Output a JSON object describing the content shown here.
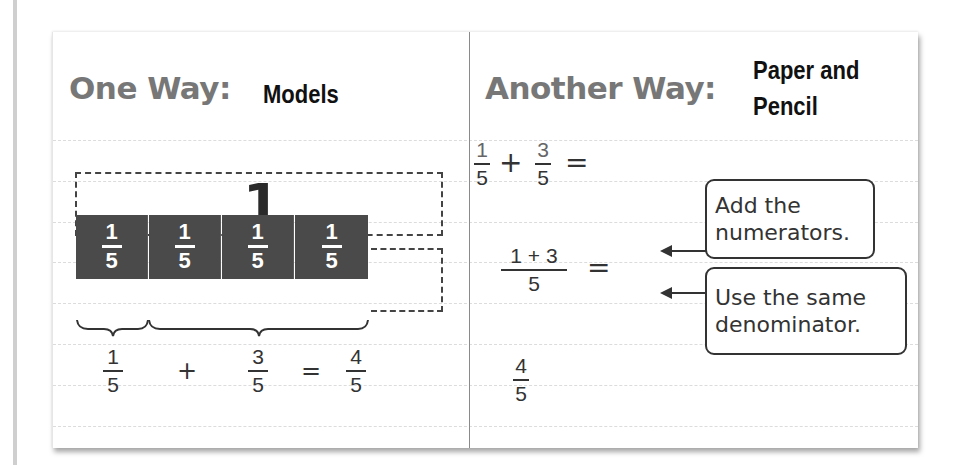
{
  "left_panel": {
    "heading": "One Way:",
    "subheading": "Models",
    "whole_label": "1",
    "tiles": [
      {
        "numerator": "1",
        "denominator": "5"
      },
      {
        "numerator": "1",
        "denominator": "5"
      },
      {
        "numerator": "1",
        "denominator": "5"
      },
      {
        "numerator": "1",
        "denominator": "5"
      }
    ],
    "equation": {
      "term1": {
        "numerator": "1",
        "denominator": "5"
      },
      "plus": "+",
      "term2": {
        "numerator": "3",
        "denominator": "5"
      },
      "equals": "=",
      "result": {
        "numerator": "4",
        "denominator": "5"
      }
    }
  },
  "right_panel": {
    "heading": "Another Way:",
    "subheading_line1": "Paper and",
    "subheading_line2": "Pencil",
    "step1": {
      "term1": {
        "numerator": "1",
        "denominator": "5"
      },
      "plus": "+",
      "term2": {
        "numerator": "3",
        "denominator": "5"
      },
      "equals": "="
    },
    "step2": {
      "numerator": "1 + 3",
      "denominator": "5",
      "equals": "="
    },
    "step3": {
      "numerator": "4",
      "denominator": "5"
    },
    "callouts": [
      {
        "line1": "Add the",
        "line2": "numerators."
      },
      {
        "line1": "Use the same",
        "line2": "denominator."
      }
    ]
  }
}
